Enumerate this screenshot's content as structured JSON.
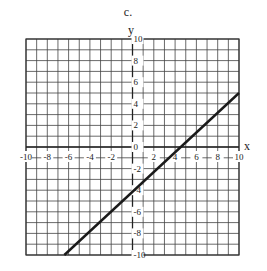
{
  "panel_label": "c.",
  "chart_data": {
    "type": "line",
    "title": "",
    "xlabel": "x",
    "ylabel": "y",
    "xlim": [
      -10,
      10
    ],
    "ylim": [
      -10,
      10
    ],
    "grid": true,
    "grid_step": 1,
    "x_ticks": [
      -10,
      -8,
      -6,
      -4,
      -2,
      2,
      4,
      6,
      8,
      10
    ],
    "y_ticks": [
      10,
      8,
      6,
      4,
      2,
      0,
      -2,
      -4,
      -6,
      -8,
      -10
    ],
    "series": [
      {
        "name": "line",
        "points": [
          [
            -6.4,
            -10
          ],
          [
            10,
            5
          ]
        ],
        "color": "#1a1a1a"
      }
    ]
  }
}
